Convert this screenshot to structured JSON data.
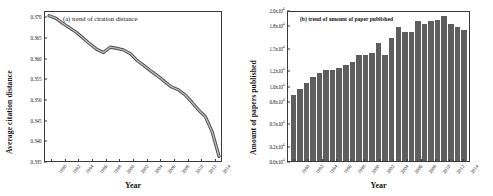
{
  "figure": {
    "panel_a": {
      "title": "(a) trend of citation distance",
      "xlabel": "Year",
      "ylabel": "Average citation distance"
    },
    "panel_b": {
      "title": "(b) trend of amount of paper published",
      "xlabel": "Year",
      "ylabel": "Amount of papers published"
    }
  },
  "chart_data": [
    {
      "type": "line",
      "title": "(a) trend of citation distance",
      "xlabel": "Year",
      "ylabel": "Average citation distance",
      "grid": false,
      "legend": "none",
      "line_color": "#6e6e6e",
      "ylim": [
        0.335,
        0.3715
      ],
      "yticks": [
        "0.335",
        "0.340",
        "0.345",
        "0.350",
        "0.355",
        "0.360",
        "0.365",
        "0.370"
      ],
      "ytick_values": [
        0.335,
        0.34,
        0.345,
        0.35,
        0.355,
        0.36,
        0.365,
        0.37
      ],
      "xtick_labels": [
        "1990",
        "1992",
        "1994",
        "1996",
        "1998",
        "2000",
        "2002",
        "2004",
        "2006",
        "2008",
        "2010",
        "2012",
        "2014"
      ],
      "x": [
        1990,
        1991,
        1992,
        1993,
        1994,
        1995,
        1996,
        1997,
        1998,
        1999,
        2000,
        2001,
        2002,
        2003,
        2004,
        2005,
        2006,
        2007,
        2008,
        2009,
        2010,
        2011,
        2012,
        2013,
        2014,
        2015
      ],
      "values": [
        0.3706,
        0.37,
        0.3688,
        0.3677,
        0.3666,
        0.3652,
        0.3638,
        0.3625,
        0.3617,
        0.363,
        0.3627,
        0.3623,
        0.3614,
        0.3597,
        0.3585,
        0.3572,
        0.356,
        0.3547,
        0.3534,
        0.3527,
        0.3515,
        0.3497,
        0.3478,
        0.3462,
        0.3425,
        0.3366
      ]
    },
    {
      "type": "bar",
      "title": "(b) trend of amount of paper published",
      "xlabel": "Year",
      "ylabel": "Amount of papers published",
      "grid": false,
      "legend": "none",
      "bar_color": "#5e5e5e",
      "ylim": [
        0,
        20000
      ],
      "yticks": [
        "0.0x10",
        "0.2x10",
        "0.5x10",
        "0.8x10",
        "1.0x10",
        "1.2x10",
        "1.5x10",
        "1.8x10",
        "2.0x10"
      ],
      "ytick_exponent": "4",
      "ytick_values": [
        0,
        2000,
        5000,
        8000,
        10000,
        12000,
        15000,
        18000,
        20000
      ],
      "xtick_labels": [
        "1990",
        "1992",
        "1994",
        "1996",
        "1998",
        "2000",
        "2002",
        "2004",
        "2006",
        "2008",
        "2010",
        "2012",
        "2014"
      ],
      "categories": [
        1990,
        1991,
        1992,
        1993,
        1994,
        1995,
        1996,
        1997,
        1998,
        1999,
        2000,
        2001,
        2002,
        2003,
        2004,
        2005,
        2006,
        2007,
        2008,
        2009,
        2010,
        2011,
        2012,
        2013,
        2014,
        2015
      ],
      "values": [
        8700,
        9500,
        10300,
        11100,
        11600,
        12000,
        12100,
        12300,
        12700,
        13100,
        14100,
        14100,
        14300,
        15600,
        14100,
        16300,
        17800,
        17100,
        17100,
        18500,
        18100,
        18600,
        18700,
        19200,
        18200,
        17800,
        17300
      ]
    }
  ]
}
